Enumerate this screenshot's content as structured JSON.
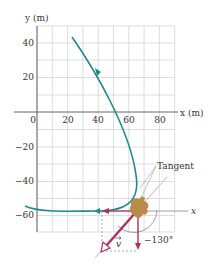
{
  "axes": {
    "y_label": "y (m)",
    "x_label": "x (m)",
    "x_ticks": [
      "0",
      "20",
      "40",
      "60",
      "80"
    ],
    "y_ticks": [
      "40",
      "20",
      "−20",
      "−40",
      "−60"
    ],
    "x_range": [
      0,
      90
    ],
    "y_range": [
      -70,
      50
    ],
    "grid_step": 10
  },
  "annotations": {
    "tangent_label": "Tangent",
    "local_x_label": "x",
    "velocity_label": "v",
    "angle_label": "−130°"
  },
  "colors": {
    "path": "#1f8a8a",
    "vector": "#b0305a",
    "grid": "#d4d4d4",
    "axis": "#555555",
    "rabbit": "#b98a4a",
    "tangent": "#e0a0b0"
  }
}
